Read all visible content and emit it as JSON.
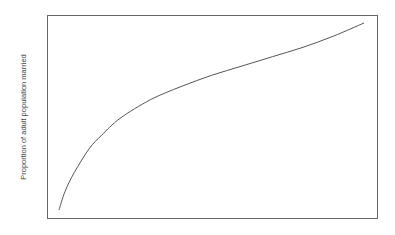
{
  "chart_data": {
    "type": "line",
    "title": "",
    "xlabel": "",
    "ylabel": "Proportion of adult population married",
    "grid": false,
    "legend": null,
    "axes_ticks": "none",
    "series": [
      {
        "name": "married proportion",
        "color": "#555555",
        "x": [
          0.0,
          0.02,
          0.05,
          0.1,
          0.14,
          0.2,
          0.3,
          0.4,
          0.5,
          0.6,
          0.7,
          0.8,
          0.9,
          1.0
        ],
        "y": [
          0.0,
          0.1,
          0.2,
          0.33,
          0.4,
          0.49,
          0.59,
          0.66,
          0.72,
          0.77,
          0.82,
          0.87,
          0.93,
          1.0
        ]
      }
    ],
    "shape_note": "Concave, monotonically increasing curve (steep at left, flattening toward right)"
  }
}
